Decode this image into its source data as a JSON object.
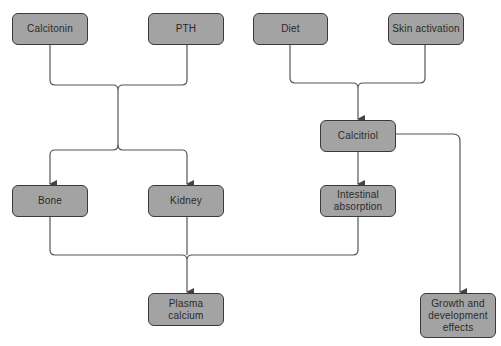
{
  "diagram": {
    "type": "flowchart",
    "colors": {
      "node_fill": "#a3a3a3",
      "node_border": "#3a3a3a",
      "line": "#555555",
      "text": "#2a2a2a",
      "background": "#ffffff"
    },
    "nodes": [
      {
        "id": "calcitonin",
        "label": "Calcitonin"
      },
      {
        "id": "pth",
        "label": "PTH"
      },
      {
        "id": "diet",
        "label": "Diet"
      },
      {
        "id": "skin",
        "label": "Skin activation"
      },
      {
        "id": "calcitriol",
        "label": "Calcitriol"
      },
      {
        "id": "bone",
        "label": "Bone"
      },
      {
        "id": "kidney",
        "label": "Kidney"
      },
      {
        "id": "intestinal",
        "label": "Intestinal\nabsorption"
      },
      {
        "id": "plasma",
        "label": "Plasma\ncalcium"
      },
      {
        "id": "growth",
        "label": "Growth and\ndevelopment\neffects"
      }
    ],
    "edges": [
      {
        "from": [
          "calcitonin",
          "pth"
        ],
        "to": [
          "bone",
          "kidney"
        ]
      },
      {
        "from": [
          "diet",
          "skin"
        ],
        "to": [
          "calcitriol"
        ]
      },
      {
        "from": [
          "calcitriol"
        ],
        "to": [
          "intestinal"
        ]
      },
      {
        "from": [
          "calcitriol"
        ],
        "to": [
          "growth"
        ]
      },
      {
        "from": [
          "bone",
          "kidney",
          "intestinal"
        ],
        "to": [
          "plasma"
        ]
      }
    ]
  }
}
